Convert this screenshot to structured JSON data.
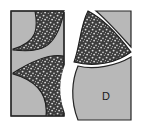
{
  "figure": {
    "canvas": {
      "width": 142,
      "height": 131,
      "background": "#ffffff"
    },
    "colors": {
      "panel_gray": "#b3b3b3",
      "panel_gray_light": "#c4c4c4",
      "stipple_dark": "#3d3d3d",
      "stipple_dot": "#dcdcdc",
      "outline": "#262626",
      "channel_white": "#ffffff"
    },
    "labels": {
      "piece_d": "D"
    },
    "regions": [
      {
        "name": "left-panel",
        "fill": "#b3b3b3",
        "description": "upright light gray rectangle on the left"
      },
      {
        "name": "upper-left-wedge",
        "fill": "#3d3d3d",
        "description": "dark stippled curved wedge in upper left panel"
      },
      {
        "name": "lower-left-wedge",
        "fill": "#3d3d3d",
        "description": "dark stippled curved wedge in lower left panel"
      },
      {
        "name": "center-channel",
        "fill": "#ffffff",
        "description": "white S-shaped channel separating left and right halves"
      },
      {
        "name": "right-wedge",
        "fill": "#3d3d3d",
        "description": "dark stippled curved wedge on the right half, upper area"
      },
      {
        "name": "top-right-panel",
        "fill": "#b3b3b3",
        "description": "light gray quadrilateral at the top right with curved lower-left edge"
      },
      {
        "name": "piece-d-panel",
        "fill": "#b3b3b3",
        "description": "light gray piece at the bottom right labeled D"
      }
    ]
  }
}
